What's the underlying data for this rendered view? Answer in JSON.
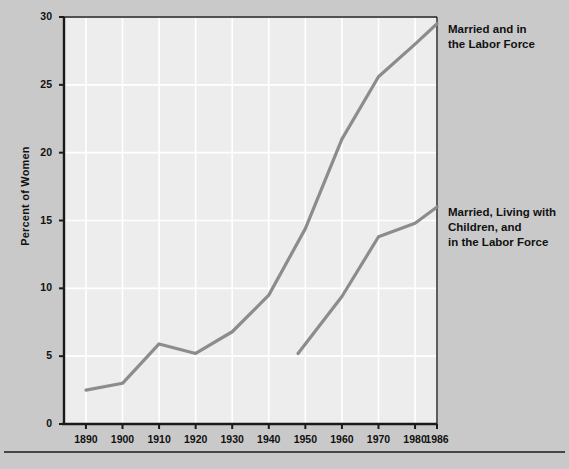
{
  "chart_data": {
    "type": "line",
    "title": "",
    "xlabel": "",
    "ylabel": "Percent of Women",
    "xlim": [
      1884,
      1986
    ],
    "ylim": [
      0,
      30
    ],
    "grid": true,
    "legend_position": "right-of-plot-inline",
    "xticks": [
      "1890",
      "1900",
      "1910",
      "1920",
      "1930",
      "1940",
      "1950",
      "1960",
      "1970",
      "1980",
      "1986"
    ],
    "yticks": [
      "0",
      "5",
      "10",
      "15",
      "20",
      "25",
      "30"
    ],
    "series": [
      {
        "name": "Married and in the Labor Force",
        "label_lines": [
          "Married and in",
          "the Labor Force"
        ],
        "color": "#8c8c8c",
        "x": [
          1890,
          1900,
          1910,
          1920,
          1930,
          1940,
          1950,
          1960,
          1970,
          1980,
          1986
        ],
        "values": [
          2.5,
          3.0,
          5.9,
          5.2,
          6.8,
          9.5,
          14.4,
          21.0,
          25.6,
          28.0,
          29.5
        ]
      },
      {
        "name": "Married, Living with Children, and in the Labor Force",
        "label_lines": [
          "Married, Living with",
          "Children, and",
          "in the Labor Force"
        ],
        "color": "#8c8c8c",
        "x": [
          1948,
          1960,
          1970,
          1980,
          1986
        ],
        "values": [
          5.2,
          9.4,
          13.8,
          14.8,
          16.0
        ]
      }
    ]
  },
  "axis": {
    "y_title": "Percent of Women"
  },
  "annotations": {
    "series1_line1": "Married and in",
    "series1_line2": "the Labor Force",
    "series2_line1": "Married, Living with",
    "series2_line2": "Children, and",
    "series2_line3": "in the Labor Force"
  },
  "colors": {
    "page_background": "#c9c9c9",
    "plot_background": "#ededed",
    "grid": "#ffffff",
    "axis": "#1a1a1a",
    "line": "#8c8c8c",
    "text": "#111111"
  }
}
